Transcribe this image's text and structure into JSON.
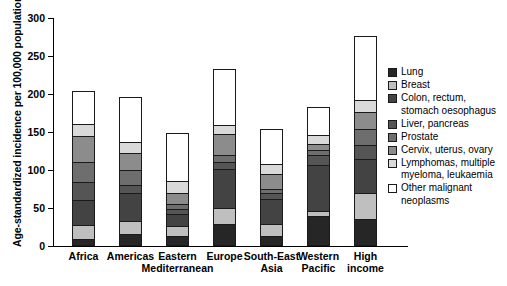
{
  "chart_data": {
    "type": "bar",
    "subtype": "stacked-bar",
    "title": "",
    "xlabel": "",
    "ylabel": "Age-standardized incidence per 100,000 population",
    "ylim": [
      0,
      300
    ],
    "yticks": [
      0,
      50,
      100,
      150,
      200,
      250,
      300
    ],
    "grid": false,
    "legend_position": "right",
    "categories": [
      "Africa",
      "Americas",
      "Eastern Mediterranean",
      "Europe",
      "South-East Asia",
      "Western Pacific",
      "High income"
    ],
    "category_lines": [
      [
        "Africa",
        ""
      ],
      [
        "Americas",
        ""
      ],
      [
        "Eastern",
        "Mediterranean"
      ],
      [
        "Europe",
        ""
      ],
      [
        "South-East",
        "Asia"
      ],
      [
        "Western",
        "Pacific"
      ],
      [
        "High",
        "income"
      ]
    ],
    "series": [
      {
        "name": "Lung",
        "color": "#262626",
        "values": [
          6,
          13,
          10,
          27,
          10,
          37,
          33
        ]
      },
      {
        "name": "Breast",
        "color": "#bfbfbf",
        "values": [
          19,
          17,
          14,
          20,
          17,
          7,
          35
        ]
      },
      {
        "name": "Colon, rectum, stomach oesophagus",
        "color": "#434343",
        "values": [
          33,
          38,
          16,
          52,
          33,
          61,
          45
        ]
      },
      {
        "name": "Liver, pancreas",
        "color": "#555555",
        "values": [
          24,
          10,
          6,
          9,
          8,
          13,
          18
        ]
      },
      {
        "name": "Prostate",
        "color": "#6e6e6e",
        "values": [
          27,
          20,
          7,
          10,
          5,
          6,
          21
        ]
      },
      {
        "name": "Cervix, uterus, ovary",
        "color": "#8c8c8c",
        "values": [
          34,
          22,
          15,
          27,
          20,
          9,
          22
        ]
      },
      {
        "name": "Lymphomas, multiple myeloma, leukaemia",
        "color": "#d9d9d9",
        "values": [
          16,
          15,
          15,
          12,
          13,
          12,
          16
        ]
      },
      {
        "name": "Other malignant neoplasms",
        "color": "#ffffff",
        "values": [
          44,
          60,
          65,
          74,
          47,
          37,
          85
        ]
      }
    ],
    "totals": [
      203,
      195,
      148,
      231,
      153,
      182,
      275
    ]
  },
  "legend": {
    "entries": [
      {
        "label": "Lung"
      },
      {
        "label": "Breast"
      },
      {
        "label": "Colon, rectum,\nstomach oesophagus"
      },
      {
        "label": "Liver, pancreas"
      },
      {
        "label": "Prostate"
      },
      {
        "label": "Cervix, uterus, ovary"
      },
      {
        "label": "Lymphomas, multiple\nmyeloma, leukaemia"
      },
      {
        "label": "Other malignant\nneoplasms"
      }
    ]
  }
}
